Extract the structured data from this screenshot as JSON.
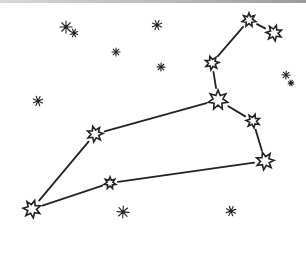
{
  "illustration": {
    "subject": "Leo constellation",
    "style": "hand-drawn ink sketch",
    "colors": {
      "ink": "#222222",
      "background": "#ffffff",
      "topbar": "#bdbdbd"
    },
    "constellation_stars": [
      {
        "id": "s1",
        "x": 249,
        "y": 20,
        "r": 7
      },
      {
        "id": "s2",
        "x": 274,
        "y": 33,
        "r": 8
      },
      {
        "id": "s3",
        "x": 212,
        "y": 63,
        "r": 7
      },
      {
        "id": "s4",
        "x": 218,
        "y": 100,
        "r": 10
      },
      {
        "id": "s5",
        "x": 253,
        "y": 121,
        "r": 7
      },
      {
        "id": "s6",
        "x": 265,
        "y": 161,
        "r": 9
      },
      {
        "id": "s7",
        "x": 110,
        "y": 183,
        "r": 6
      },
      {
        "id": "s8",
        "x": 32,
        "y": 209,
        "r": 9
      },
      {
        "id": "s9",
        "x": 95,
        "y": 134,
        "r": 8
      }
    ],
    "lines": [
      [
        "s2",
        "s1"
      ],
      [
        "s1",
        "s3"
      ],
      [
        "s3",
        "s4"
      ],
      [
        "s4",
        "s5"
      ],
      [
        "s5",
        "s6"
      ],
      [
        "s6",
        "s7"
      ],
      [
        "s7",
        "s8"
      ],
      [
        "s8",
        "s9"
      ],
      [
        "s9",
        "s4"
      ]
    ],
    "background_stars": [
      {
        "x": 66,
        "y": 27,
        "r": 6
      },
      {
        "x": 74,
        "y": 33,
        "r": 4
      },
      {
        "x": 116,
        "y": 52,
        "r": 4
      },
      {
        "x": 157,
        "y": 25,
        "r": 5
      },
      {
        "x": 161,
        "y": 67,
        "r": 4
      },
      {
        "x": 38,
        "y": 101,
        "r": 5
      },
      {
        "x": 286,
        "y": 75,
        "r": 4
      },
      {
        "x": 291,
        "y": 83,
        "r": 3
      },
      {
        "x": 123,
        "y": 212,
        "r": 6
      },
      {
        "x": 231,
        "y": 211,
        "r": 5
      }
    ]
  }
}
